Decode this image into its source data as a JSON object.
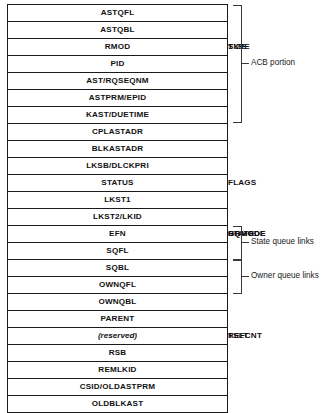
{
  "diagram": {
    "rows": [
      {
        "cells": [
          {
            "label": "ASTQFL",
            "width": 100
          }
        ]
      },
      {
        "cells": [
          {
            "label": "ASTQBL",
            "width": 100
          }
        ]
      },
      {
        "cells": [
          {
            "label": "RMOD",
            "width": 24
          },
          {
            "label": "TYPE",
            "width": 25
          },
          {
            "label": "SIZE",
            "width": 51
          }
        ]
      },
      {
        "cells": [
          {
            "label": "PID",
            "width": 100
          }
        ]
      },
      {
        "cells": [
          {
            "label": "AST/RQSEQNM",
            "width": 100
          }
        ]
      },
      {
        "cells": [
          {
            "label": "ASTPRM/EPID",
            "width": 100
          }
        ]
      },
      {
        "cells": [
          {
            "label": "KAST/DUETIME",
            "width": 100
          }
        ]
      },
      {
        "cells": [
          {
            "label": "CPLASTADR",
            "width": 100
          }
        ]
      },
      {
        "cells": [
          {
            "label": "BLKASTADR",
            "width": 100
          }
        ]
      },
      {
        "cells": [
          {
            "label": "LKSB/DLCKPRI",
            "width": 100
          }
        ]
      },
      {
        "cells": [
          {
            "label": "STATUS",
            "width": 49
          },
          {
            "label": "FLAGS",
            "width": 51
          }
        ]
      },
      {
        "cells": [
          {
            "label": "LKST1",
            "width": 100
          }
        ]
      },
      {
        "cells": [
          {
            "label": "LKST2/LKID",
            "width": 100
          }
        ]
      },
      {
        "cells": [
          {
            "label": "EFN",
            "width": 24
          },
          {
            "label": "STATE",
            "width": 25
          },
          {
            "label": "GRMODE",
            "width": 26
          },
          {
            "label": "RQMODE",
            "width": 25
          }
        ]
      },
      {
        "cells": [
          {
            "label": "SQFL",
            "width": 100
          }
        ]
      },
      {
        "cells": [
          {
            "label": "SQBL",
            "width": 100
          }
        ]
      },
      {
        "cells": [
          {
            "label": "OWNQFL",
            "width": 100
          }
        ]
      },
      {
        "cells": [
          {
            "label": "OWNQBL",
            "width": 100
          }
        ]
      },
      {
        "cells": [
          {
            "label": "PARENT",
            "width": 100
          }
        ]
      },
      {
        "cells": [
          {
            "label": "(reserved)",
            "width": 24,
            "italic": true
          },
          {
            "label": "TSLT",
            "width": 25
          },
          {
            "label": "REFCNT",
            "width": 51
          }
        ]
      },
      {
        "cells": [
          {
            "label": "RSB",
            "width": 100
          }
        ]
      },
      {
        "cells": [
          {
            "label": "REMLKID",
            "width": 100
          }
        ]
      },
      {
        "cells": [
          {
            "label": "CSID/OLDASTPRM",
            "width": 100
          }
        ]
      },
      {
        "cells": [
          {
            "label": "OLDBLKAST",
            "width": 100
          }
        ]
      }
    ],
    "annotations": {
      "acb_portion": "ACB portion",
      "state_queue_links": "State queue links",
      "owner_queue_links": "Owner queue links"
    },
    "colors": {
      "line": "#1a1a1a",
      "bracket": "#3a3a3a",
      "text": "#111111",
      "background": "#ffffff"
    }
  }
}
